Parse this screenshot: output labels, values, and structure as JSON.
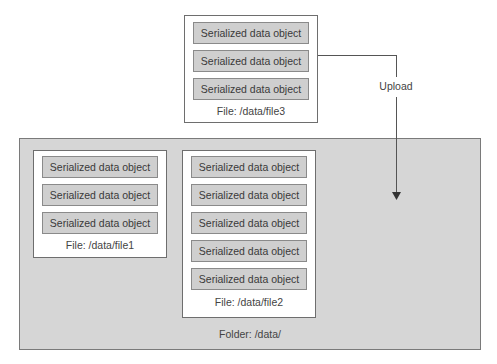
{
  "upload": {
    "label": "Upload"
  },
  "folder": {
    "label": "Folder: /data/"
  },
  "files": {
    "file3": {
      "label": "File: /data/file3",
      "objects": [
        "Serialized data object",
        "Serialized data object",
        "Serialized data object"
      ]
    },
    "file1": {
      "label": "File: /data/file1",
      "objects": [
        "Serialized data object",
        "Serialized data object",
        "Serialized data object"
      ]
    },
    "file2": {
      "label": "File: /data/file2",
      "objects": [
        "Serialized data object",
        "Serialized data object",
        "Serialized data object",
        "Serialized data object",
        "Serialized data object"
      ]
    }
  },
  "colors": {
    "folder_bg": "#d6d6d6",
    "object_bg": "#cfcfcf",
    "file_bg": "#ffffff",
    "line": "#555555"
  }
}
